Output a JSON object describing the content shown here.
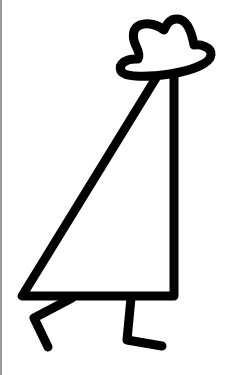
{
  "figure": {
    "stroke_color": "#000000",
    "background": "#ffffff",
    "edge_color": "#9a9a9a"
  }
}
